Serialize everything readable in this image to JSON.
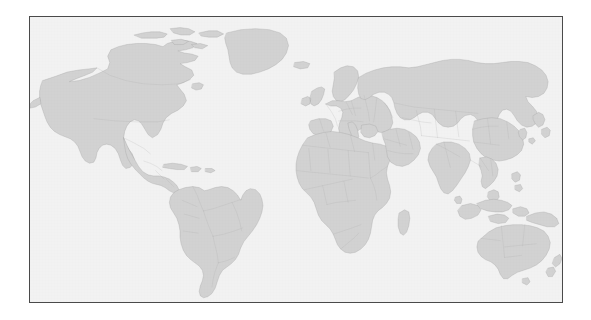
{
  "figure": {
    "kind": "world-map",
    "title": "",
    "caption": "",
    "projection": "miller-cylindrical",
    "frame": {
      "border_color": "#4a4a4a",
      "border_width_px": 1,
      "x": 29,
      "y": 16,
      "width": 534,
      "height": 287
    },
    "colors": {
      "page_background": "#ffffff",
      "ocean": "#f2f2f2",
      "land_fill": "#d2d2d2",
      "coastline": "#9a9a9a",
      "country_border": "#a8a8a8"
    },
    "extent": {
      "lon_min": -180,
      "lon_max": 180,
      "lat_min": -58,
      "lat_max": 84
    },
    "features_shown": [
      "continents",
      "country-borders",
      "major-islands"
    ],
    "features_omitted": [
      "antarctica",
      "graticule",
      "labels",
      "legend",
      "scale-bar"
    ],
    "regions": [
      {
        "name": "North America",
        "id": "north-america"
      },
      {
        "name": "Greenland",
        "id": "greenland"
      },
      {
        "name": "Iceland",
        "id": "iceland"
      },
      {
        "name": "South America",
        "id": "south-america"
      },
      {
        "name": "Europe",
        "id": "europe"
      },
      {
        "name": "Africa",
        "id": "africa"
      },
      {
        "name": "Madagascar",
        "id": "madagascar"
      },
      {
        "name": "Asia",
        "id": "asia"
      },
      {
        "name": "Japan",
        "id": "japan"
      },
      {
        "name": "Southeast Asia and Indonesia",
        "id": "indonesia"
      },
      {
        "name": "Philippines",
        "id": "philippines"
      },
      {
        "name": "Australia",
        "id": "australia"
      },
      {
        "name": "New Zealand",
        "id": "new-zealand"
      },
      {
        "name": "British Isles",
        "id": "british-isles"
      },
      {
        "name": "Caribbean",
        "id": "caribbean"
      },
      {
        "name": "Sri Lanka",
        "id": "sri-lanka"
      },
      {
        "name": "New Guinea",
        "id": "new-guinea"
      }
    ]
  }
}
